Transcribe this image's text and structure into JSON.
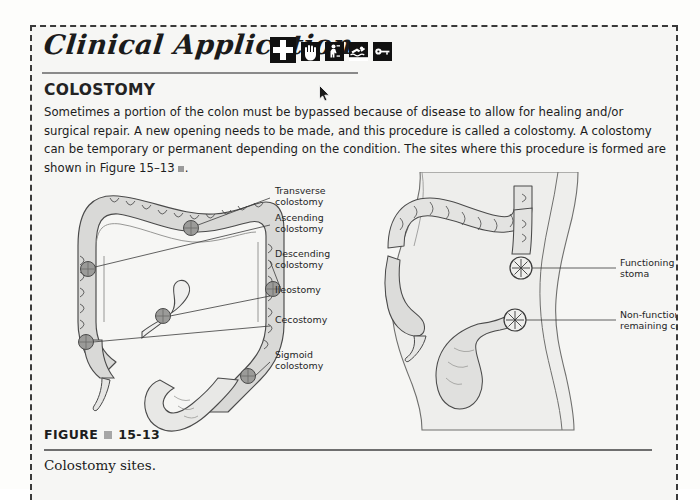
{
  "box": {
    "border_color": "#3a3a3a",
    "background": "#f6f6f4"
  },
  "header": {
    "title": "Clinical Application",
    "icons": [
      {
        "name": "medical-cross-icon",
        "glyph": "cross",
        "size": "large"
      },
      {
        "name": "hand-icon",
        "glyph": "hand",
        "size": "small"
      },
      {
        "name": "person-lifting-icon",
        "glyph": "person",
        "size": "small"
      },
      {
        "name": "swimmer-icon",
        "glyph": "swimmer",
        "size": "small"
      },
      {
        "name": "key-icon",
        "glyph": "key",
        "size": "small"
      }
    ],
    "cursor": {
      "name": "mouse-cursor",
      "x": 287,
      "y": 58
    }
  },
  "section": {
    "title": "COLOSTOMY",
    "paragraph_part1": "Sometimes a portion of the colon must be bypassed because of disease to allow for healing and/or surgical repair. A new opening needs to be made, and this procedure is called a colostomy. A colostomy can be temporary or permanent depending on the condition. The sites where this procedure is formed are shown in Figure 15–13",
    "paragraph_end": "."
  },
  "figure": {
    "label_word": "FIGURE",
    "number": "15-13",
    "caption": "Colostomy sites.",
    "left_diagram": {
      "name": "colon-anatomy-diagram",
      "labels": [
        {
          "id": "transverse",
          "line1": "Transverse",
          "line2": "colostomy"
        },
        {
          "id": "ascending",
          "line1": "Ascending",
          "line2": "colostomy"
        },
        {
          "id": "descending",
          "line1": "Descending",
          "line2": "colostomy"
        },
        {
          "id": "ileostomy",
          "line1": "Ileostomy",
          "line2": ""
        },
        {
          "id": "cecostomy",
          "line1": "Cecostomy",
          "line2": ""
        },
        {
          "id": "sigmoid",
          "line1": "Sigmoid",
          "line2": "colostomy"
        }
      ],
      "stoma_marker_count": 6
    },
    "right_diagram": {
      "name": "body-colostomy-diagram",
      "labels": [
        {
          "id": "functioning-stoma",
          "line1": "Functioning",
          "line2": "stoma"
        },
        {
          "id": "non-functioning-colon",
          "line1": "Non-functioning",
          "line2": "remaining colon"
        }
      ],
      "stoma_marker_count": 2
    }
  },
  "colors": {
    "page_background": "#fdfdfb",
    "panel_background": "#f6f6f4",
    "text": "#1c1c1c",
    "rule": "#6f6f6f",
    "organ_fill": "#d8d8d6",
    "organ_stroke": "#4a4a4a",
    "stoma_fill": "#9a9a98"
  }
}
